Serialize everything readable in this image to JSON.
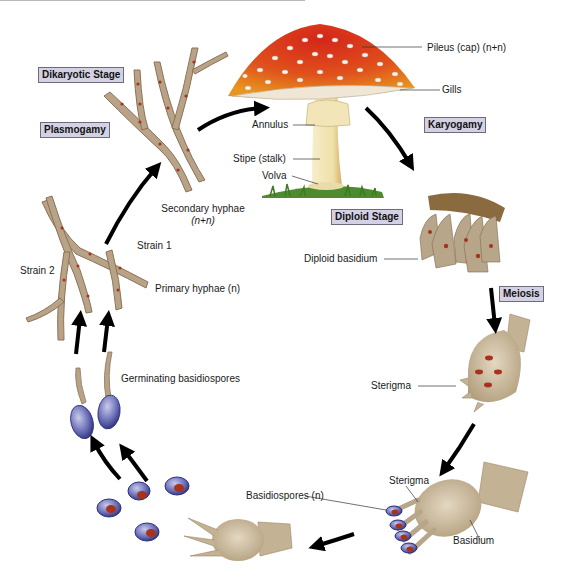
{
  "diagram": {
    "type": "life-cycle",
    "stage_boxes": {
      "dikaryotic": "Dikaryotic Stage",
      "plasmogamy": "Plasmogamy",
      "karyogamy": "Karyogamy",
      "diploid": "Diploid Stage",
      "meiosis": "Meiosis"
    },
    "labels": {
      "pileus": "Pileus (cap) (n+n)",
      "gills": "Gills",
      "annulus": "Annulus",
      "stipe": "Stipe (stalk)",
      "volva": "Volva",
      "secondary_hyphae_1": "Secondary hyphae",
      "secondary_hyphae_2": "(n+n)",
      "strain1": "Strain 1",
      "strain2": "Strain 2",
      "primary_hyphae": "Primary hyphae (n)",
      "diploid_basidium": "Diploid basidium",
      "sterigma_top": "Sterigma",
      "germinating": "Germinating basidiospores",
      "basidiospores": "Basidiospores (n)",
      "sterigma_bottom": "Sterigma",
      "basidium": "Basidium"
    },
    "colors": {
      "stage_box_fill": "#d4d1e4",
      "stage_box_border": "#6b6b7a",
      "cap_red": "#d8371c",
      "cap_orange": "#e88a1e",
      "hyphae": "#b8a288",
      "nucleus": "#a8321c",
      "spore": "#5a5ea8",
      "basidium": "#c4b294",
      "arrow": "#000000"
    }
  }
}
